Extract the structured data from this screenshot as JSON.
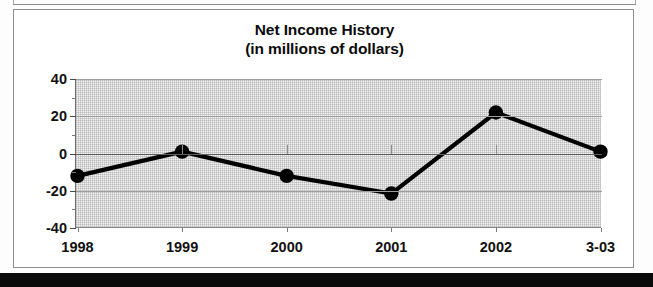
{
  "chart_data": {
    "type": "line",
    "title": "Net Income History",
    "subtitle": "(in millions of dollars)",
    "xlabel": "",
    "ylabel": "",
    "categories": [
      "1998",
      "1999",
      "2000",
      "2001",
      "2002",
      "3-03"
    ],
    "values": [
      -12,
      1,
      -12,
      -21.5,
      22,
      1
    ],
    "ylim": [
      -40,
      40
    ],
    "yticks": [
      40,
      20,
      0,
      -20,
      -40
    ],
    "ytick_labels": [
      "40",
      "20",
      "0",
      "-20",
      "-40"
    ],
    "minor_yticks": [
      30,
      10,
      -10,
      -30
    ],
    "grid": true,
    "grid_orientation": "horizontal",
    "legend": "none",
    "series": [
      {
        "name": "Net Income",
        "values": [
          -12,
          1,
          -12,
          -21.5,
          22,
          1
        ],
        "line_color": "#000000",
        "marker": "circle",
        "marker_color": "#000000"
      }
    ],
    "plot_background": "#f2f2f2",
    "plot_texture": "stippled-gray"
  },
  "figure": {
    "title_line1": "Net Income History",
    "title_line2": "(in millions of dollars)"
  }
}
